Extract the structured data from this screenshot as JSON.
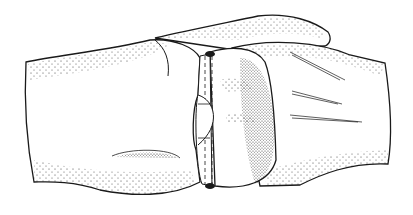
{
  "figure": {
    "description": "Stippled line illustration of two joined cylindrical bone-like segments with a central band joint",
    "colors": {
      "background": "#ffffff",
      "ink": "#1a1a1a"
    }
  }
}
